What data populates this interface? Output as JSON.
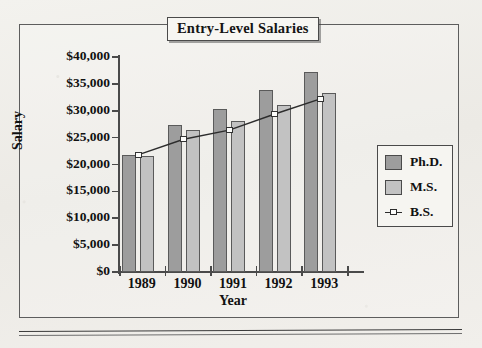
{
  "chart_data": {
    "type": "bar",
    "title": "Entry-Level Salaries",
    "xlabel": "Year",
    "ylabel": "Salary",
    "categories": [
      "1989",
      "1990",
      "1991",
      "1992",
      "1993"
    ],
    "series": [
      {
        "name": "Ph.D.",
        "type": "bar",
        "color": "#9d9d9d",
        "values": [
          21700,
          27300,
          30300,
          33800,
          37200
        ]
      },
      {
        "name": "M.S.",
        "type": "bar",
        "color": "#c2c2c2",
        "values": [
          21600,
          26500,
          28100,
          31000,
          33300
        ]
      },
      {
        "name": "B.S.",
        "type": "line",
        "color": "#2c2c2c",
        "values": [
          21800,
          24700,
          26400,
          29400,
          32200
        ]
      }
    ],
    "ylim": [
      0,
      40000
    ],
    "ytick_values": [
      0,
      5000,
      10000,
      15000,
      20000,
      25000,
      30000,
      35000,
      40000
    ],
    "ytick_labels": [
      "$0",
      "$5,000",
      "$10,000",
      "$15,000",
      "$20,000",
      "$25,000",
      "$30,000",
      "$35,000",
      "$40,000"
    ],
    "grid": false,
    "legend_position": "right"
  },
  "legend": {
    "entries": [
      {
        "label": "Ph.D.",
        "marker": "filled-square-dark"
      },
      {
        "label": "M.S.",
        "marker": "filled-square-light"
      },
      {
        "label": "B.S.",
        "marker": "line-with-open-square"
      }
    ]
  }
}
